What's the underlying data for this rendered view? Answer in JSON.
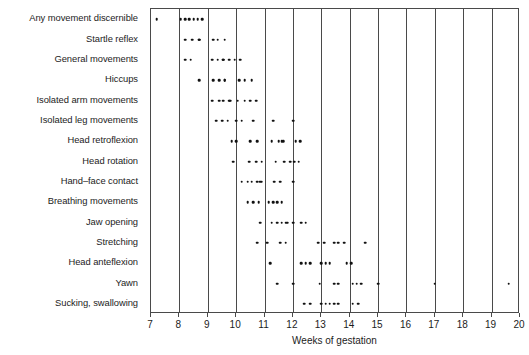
{
  "chart_data": {
    "type": "scatter",
    "title": "",
    "xlabel": "Weeks of gestation",
    "ylabel": "",
    "xlim": [
      7,
      20
    ],
    "xticks": [
      7,
      8,
      9,
      10,
      11,
      12,
      13,
      14,
      15,
      16,
      17,
      18,
      19,
      20
    ],
    "xticklabels": [
      "7",
      "8",
      "9",
      "10",
      "11",
      "12",
      "13",
      "14",
      "15",
      "16",
      "17",
      "18",
      "19",
      "20"
    ],
    "grid": "vertical",
    "legend": "none",
    "categories": [
      "Any movement discernible",
      "Startle reflex",
      "General movements",
      "Hiccups",
      "Isolated arm movements",
      "Isolated leg movements",
      "Head retroflexion",
      "Head rotation",
      "Hand–face contact",
      "Breathing movements",
      "Jaw opening",
      "Stretching",
      "Head anteflexion",
      "Yawn",
      "Sucking, swallowing"
    ],
    "series": [
      {
        "name": "Any movement discernible",
        "x": [
          7.2,
          8.05,
          8.2,
          8.35,
          8.5,
          8.65,
          8.8
        ]
      },
      {
        "name": "Startle reflex",
        "x": [
          8.2,
          8.45,
          8.7,
          8.7,
          9.2,
          9.35,
          9.6
        ]
      },
      {
        "name": "General movements",
        "x": [
          8.2,
          8.4,
          9.15,
          9.35,
          9.55,
          9.55,
          9.75,
          9.95,
          10.15
        ]
      },
      {
        "name": "Hiccups",
        "x": [
          8.7,
          9.2,
          9.4,
          9.6,
          9.6,
          10.1,
          10.3,
          10.55
        ]
      },
      {
        "name": "Isolated arm movements",
        "x": [
          9.15,
          9.4,
          9.55,
          9.75,
          9.8,
          10.05,
          10.3,
          10.5,
          10.7
        ]
      },
      {
        "name": "Isolated leg movements",
        "x": [
          9.3,
          9.5,
          9.7,
          10.0,
          10.2,
          10.6,
          11.3,
          12.0
        ]
      },
      {
        "name": "Head retroflexion",
        "x": [
          9.85,
          10.0,
          10.5,
          10.75,
          11.25,
          11.5,
          11.6,
          11.65,
          12.1,
          12.25
        ]
      },
      {
        "name": "Head rotation",
        "x": [
          9.9,
          10.45,
          10.7,
          10.9,
          11.4,
          11.7,
          11.9,
          12.05,
          12.2
        ]
      },
      {
        "name": "Hand–face contact",
        "x": [
          10.2,
          10.4,
          10.55,
          10.75,
          10.85,
          10.9,
          11.35,
          11.55,
          12.0
        ]
      },
      {
        "name": "Breathing movements",
        "x": [
          10.4,
          10.6,
          10.8,
          11.15,
          11.3,
          11.45,
          11.6
        ]
      },
      {
        "name": "Jaw opening",
        "x": [
          10.85,
          11.25,
          11.45,
          11.6,
          11.75,
          11.8,
          12.0,
          12.3,
          12.45
        ]
      },
      {
        "name": "Stretching",
        "x": [
          10.75,
          11.1,
          11.55,
          11.75,
          12.9,
          13.1,
          13.45,
          13.6,
          13.8,
          14.55
        ]
      },
      {
        "name": "Head anteflexion",
        "x": [
          11.2,
          12.3,
          12.45,
          12.6,
          13.0,
          13.15,
          13.3,
          13.9,
          14.05
        ]
      },
      {
        "name": "Yawn",
        "x": [
          11.45,
          12.0,
          12.95,
          13.45,
          13.6,
          14.1,
          14.25,
          14.4,
          15.0,
          17.0,
          19.6
        ]
      },
      {
        "name": "Sucking, swallowing",
        "x": [
          12.4,
          12.6,
          13.0,
          13.15,
          13.3,
          13.45,
          13.6,
          14.1,
          14.3
        ]
      }
    ]
  }
}
